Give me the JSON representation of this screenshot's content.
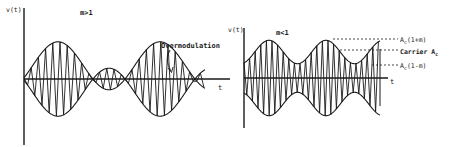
{
  "left_panel": {
    "y_axis_label": "v(t)",
    "condition_label": "m>1",
    "x_axis_label": "t",
    "annotation": "Overmodulation",
    "modulation": "m > 1",
    "description": "AM waveform with overmodulation: envelope crosses zero, causing phase reversal"
  },
  "right_panel": {
    "y_axis_label": "v(t)",
    "condition_label": "m<1",
    "x_axis_label": "t",
    "levels": [
      {
        "label_main": "A",
        "label_sub": "c",
        "label_suffix": "(1+m)",
        "meaning": "maximum envelope"
      },
      {
        "label_main": "Carrier A",
        "label_sub": "c",
        "label_suffix": "",
        "meaning": "carrier amplitude"
      },
      {
        "label_main": "A",
        "label_sub": "c",
        "label_suffix": "(1-m)",
        "meaning": "minimum envelope"
      }
    ],
    "modulation": "m < 1"
  },
  "colors": {
    "ink": "#1a1a1a",
    "background": "#ffffff"
  }
}
